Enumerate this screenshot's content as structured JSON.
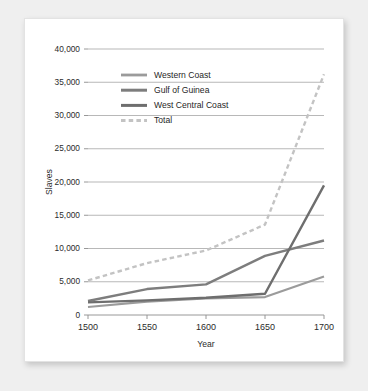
{
  "chart_data": {
    "type": "line",
    "title": "",
    "xlabel": "Year",
    "ylabel": "Slaves",
    "x": [
      1500,
      1550,
      1600,
      1650,
      1700
    ],
    "xlim": [
      1500,
      1700
    ],
    "ylim": [
      0,
      40000
    ],
    "xticks": [
      "1500",
      "1550",
      "1600",
      "1650",
      "1700"
    ],
    "yticks": [
      "0",
      "5,000",
      "10,000",
      "15,000",
      "20,000",
      "25,000",
      "30,000",
      "35,000",
      "40,000"
    ],
    "ytick_values": [
      0,
      5000,
      10000,
      15000,
      20000,
      25000,
      30000,
      35000,
      40000
    ],
    "grid": true,
    "legend_position": "upper-left-inside",
    "series": [
      {
        "name": "Western Coast",
        "values": [
          1200,
          2000,
          2500,
          2700,
          5800
        ],
        "color": "#9b9b9b",
        "style": "solid",
        "width": 2.2
      },
      {
        "name": "Gulf of Guinea",
        "values": [
          2100,
          3900,
          4600,
          8900,
          11200
        ],
        "color": "#7d7d7d",
        "style": "solid",
        "width": 2.4
      },
      {
        "name": "West Central Coast",
        "values": [
          1900,
          2200,
          2600,
          3200,
          19500
        ],
        "color": "#6e6e6e",
        "style": "solid",
        "width": 2.4
      },
      {
        "name": "Total",
        "values": [
          5200,
          7800,
          9700,
          13600,
          36200
        ],
        "color": "#c3c3c3",
        "style": "dashed",
        "width": 2.4
      }
    ]
  },
  "figure": {
    "background_color": "#ffffff",
    "page_background_color": "#efefef",
    "border_color": "#e3e3e3"
  }
}
